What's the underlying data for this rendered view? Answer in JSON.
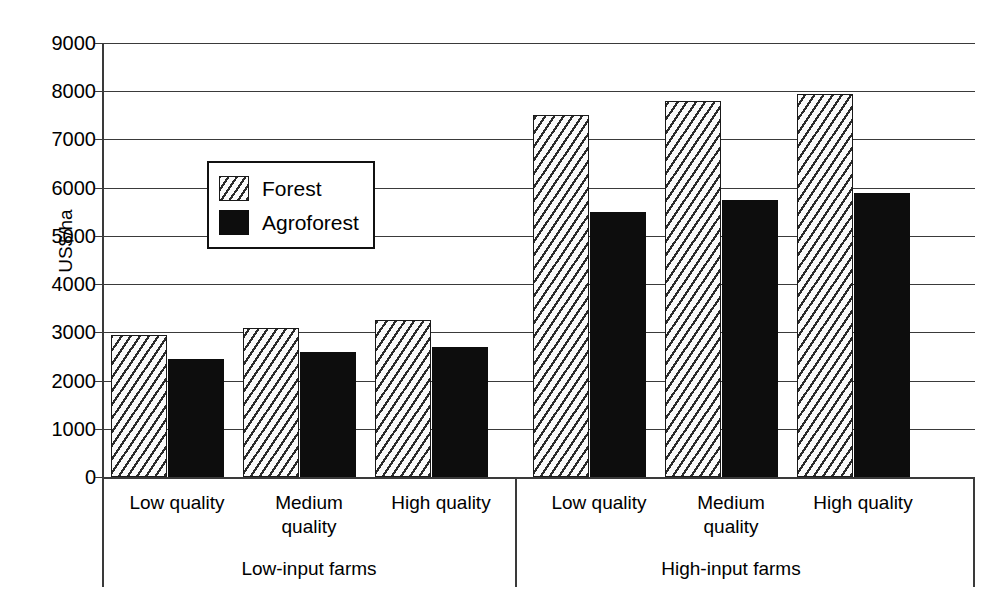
{
  "chart_data": {
    "type": "bar",
    "title": "",
    "subtitle": "",
    "xlabel": "",
    "ylabel": "US$/ha",
    "ylim": [
      0,
      9000
    ],
    "ytick_interval": 1000,
    "yticks": [
      "9000",
      "8000",
      "7000",
      "6000",
      "5000",
      "4000",
      "3000",
      "2000",
      "1000",
      "0"
    ],
    "grid": true,
    "legend_position": "inside-upper-left",
    "groups": [
      {
        "name": "Low-input farms",
        "categories": [
          "Low quality",
          "Medium quality",
          "High quality"
        ]
      },
      {
        "name": "High-input farms",
        "categories": [
          "Low quality",
          "Medium quality",
          "High quality"
        ]
      }
    ],
    "categories": [
      "Low-input farms / Low quality",
      "Low-input farms / Medium quality",
      "Low-input farms / High quality",
      "High-input farms / Low quality",
      "High-input farms / Medium quality",
      "High-input farms / High quality"
    ],
    "series": [
      {
        "name": "Forest",
        "pattern": "diagonal-hatch",
        "color": "#ffffff",
        "values": [
          2950,
          3100,
          3250,
          7500,
          7800,
          7950
        ]
      },
      {
        "name": "Agroforest",
        "pattern": "solid",
        "color": "#0d0d0d",
        "values": [
          2450,
          2600,
          2700,
          5500,
          5750,
          5900
        ]
      }
    ]
  },
  "axis": {
    "y_title": "US$/ha",
    "ticks": [
      {
        "label": "9000",
        "value": 9000
      },
      {
        "label": "8000",
        "value": 8000
      },
      {
        "label": "7000",
        "value": 7000
      },
      {
        "label": "6000",
        "value": 6000
      },
      {
        "label": "5000",
        "value": 5000
      },
      {
        "label": "4000",
        "value": 4000
      },
      {
        "label": "3000",
        "value": 3000
      },
      {
        "label": "2000",
        "value": 2000
      },
      {
        "label": "1000",
        "value": 1000
      },
      {
        "label": "0",
        "value": 0
      }
    ]
  },
  "legend": {
    "items": [
      {
        "label": "Forest",
        "style": "forest"
      },
      {
        "label": "Agroforest",
        "style": "agroforest"
      }
    ]
  },
  "category_labels": [
    "Low quality",
    "Medium\nquality",
    "High quality",
    "Low quality",
    "Medium\nquality",
    "High quality"
  ],
  "group_labels": [
    "Low-input farms",
    "High-input farms"
  ]
}
